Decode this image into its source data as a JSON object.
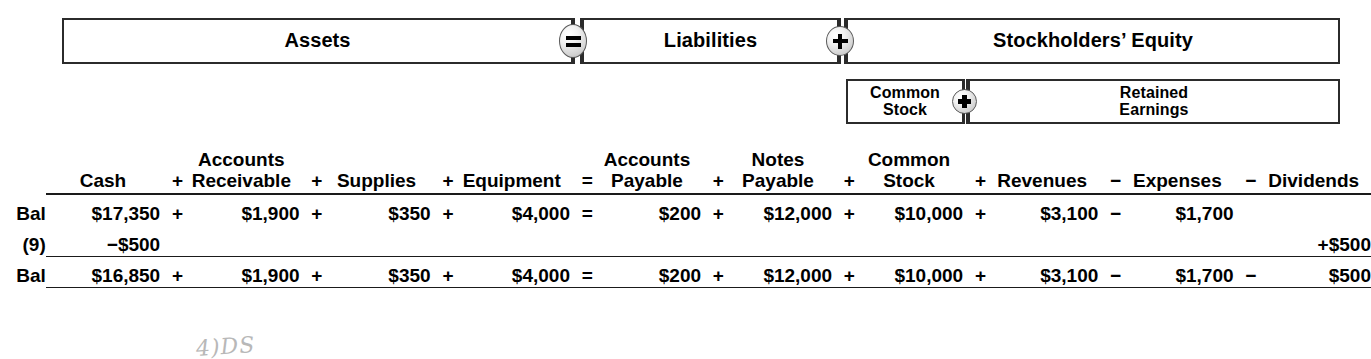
{
  "equation": {
    "assets": "Assets",
    "liabilities": "Liabilities",
    "stockholders_equity": "Stockholders’ Equity",
    "common_stock": "Common\nStock",
    "retained_earnings": "Retained\nEarnings",
    "operator_equals": "=",
    "operator_plus": "+"
  },
  "ledger": {
    "columns": [
      {
        "top": "",
        "bottom": "Cash",
        "op_before": ""
      },
      {
        "top": "Accounts",
        "bottom": "Receivable",
        "op_before": "+"
      },
      {
        "top": "",
        "bottom": "Supplies",
        "op_before": "+"
      },
      {
        "top": "",
        "bottom": "Equipment",
        "op_before": "+"
      },
      {
        "top": "Accounts",
        "bottom": "Payable",
        "op_before": "="
      },
      {
        "top": "Notes",
        "bottom": "Payable",
        "op_before": "+"
      },
      {
        "top": "Common",
        "bottom": "Stock",
        "op_before": "+"
      },
      {
        "top": "",
        "bottom": "Revenues",
        "op_before": "+"
      },
      {
        "top": "",
        "bottom": "Expenses",
        "op_before": "−"
      },
      {
        "top": "",
        "bottom": "Dividends",
        "op_before": "−"
      }
    ],
    "rows": [
      {
        "label": "Bal",
        "label_bold": false,
        "bold_values": false,
        "cells": [
          {
            "op": "",
            "value": "$17,350"
          },
          {
            "op": "+",
            "value": "$1,900"
          },
          {
            "op": "+",
            "value": "$350"
          },
          {
            "op": "+",
            "value": "$4,000"
          },
          {
            "op": "=",
            "value": "$200"
          },
          {
            "op": "+",
            "value": "$12,000"
          },
          {
            "op": "+",
            "value": "$10,000"
          },
          {
            "op": "+",
            "value": "$3,100"
          },
          {
            "op": "−",
            "value": "$1,700"
          },
          {
            "op": "",
            "value": ""
          }
        ]
      },
      {
        "label": "(9)",
        "label_bold": true,
        "bold_values": true,
        "cells": [
          {
            "op": "−",
            "value": "$500"
          },
          {
            "op": "",
            "value": ""
          },
          {
            "op": "",
            "value": ""
          },
          {
            "op": "",
            "value": ""
          },
          {
            "op": "",
            "value": ""
          },
          {
            "op": "",
            "value": ""
          },
          {
            "op": "",
            "value": ""
          },
          {
            "op": "",
            "value": ""
          },
          {
            "op": "",
            "value": ""
          },
          {
            "op": "+",
            "value": "$500"
          }
        ]
      },
      {
        "label": "Bal",
        "label_bold": false,
        "bold_values": false,
        "cells": [
          {
            "op": "",
            "value": "$16,850"
          },
          {
            "op": "+",
            "value": "$1,900"
          },
          {
            "op": "+",
            "value": "$350"
          },
          {
            "op": "+",
            "value": "$4,000"
          },
          {
            "op": "=",
            "value": "$200"
          },
          {
            "op": "+",
            "value": "$12,000"
          },
          {
            "op": "+",
            "value": "$10,000"
          },
          {
            "op": "+",
            "value": "$3,100"
          },
          {
            "op": "−",
            "value": "$1,700"
          },
          {
            "op": "−",
            "value": "$500"
          }
        ]
      }
    ]
  },
  "annotation": {
    "handwritten_note": "4)DS"
  }
}
